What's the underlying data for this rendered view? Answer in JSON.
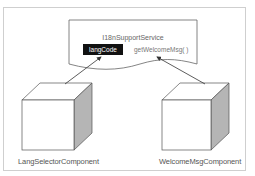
{
  "diagram": {
    "service": {
      "title": "I18nSupportService",
      "property": "langCode",
      "method": "getWelcomeMsg( )"
    },
    "components": [
      {
        "label": "LangSelectorComponent"
      },
      {
        "label": "WelcomeMsgComponent"
      }
    ],
    "edges": [
      {
        "from": "LangSelectorComponent",
        "to": "langCode"
      },
      {
        "from": "WelcomeMsgComponent",
        "to": "getWelcomeMsg( )"
      }
    ],
    "colors": {
      "frame": "#cfcfcf",
      "stroke": "#555555",
      "cube_side": "#b5b5b5",
      "property_bg": "#111111"
    }
  }
}
